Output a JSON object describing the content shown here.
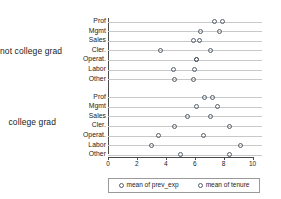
{
  "chart_data": {
    "type": "scatter",
    "title": "",
    "xlabel": "",
    "ylabel": "",
    "xlim": [
      0,
      10
    ],
    "xticks": [
      0,
      2,
      4,
      6,
      8,
      10
    ],
    "xticklabels": [
      "0",
      "2",
      "4",
      "6",
      "8",
      "10"
    ],
    "grid": true,
    "legend_position": "bottom",
    "series": [
      {
        "name": "mean of prev_exp",
        "marker": "open-circle"
      },
      {
        "name": "mean of tenure",
        "marker": "open-circle"
      }
    ],
    "groups": [
      {
        "label": "not college grad",
        "rows": [
          {
            "category": "Prof",
            "mean of prev_exp": 7.4,
            "mean of tenure": 7.9
          },
          {
            "category": "Mgmt",
            "mean of prev_exp": 6.4,
            "mean of tenure": 7.7
          },
          {
            "category": "Sales",
            "mean of prev_exp": 5.9,
            "mean of tenure": 6.3
          },
          {
            "category": "Cler.",
            "mean of prev_exp": 3.6,
            "mean of tenure": 7.1
          },
          {
            "category": "Operat.",
            "mean of prev_exp": 6.1,
            "mean of tenure": 6.1
          },
          {
            "category": "Labor",
            "mean of prev_exp": 4.5,
            "mean of tenure": 6.0
          },
          {
            "category": "Other",
            "mean of prev_exp": 4.6,
            "mean of tenure": 5.9
          }
        ]
      },
      {
        "label": "college grad",
        "rows": [
          {
            "category": "Prof",
            "mean of prev_exp": 6.7,
            "mean of tenure": 7.2
          },
          {
            "category": "Mgmt",
            "mean of prev_exp": 6.1,
            "mean of tenure": 7.6
          },
          {
            "category": "Sales",
            "mean of prev_exp": 5.5,
            "mean of tenure": 7.1
          },
          {
            "category": "Cler.",
            "mean of prev_exp": 4.6,
            "mean of tenure": 8.4
          },
          {
            "category": "Operat.",
            "mean of prev_exp": 3.5,
            "mean of tenure": 6.6
          },
          {
            "category": "Labor",
            "mean of prev_exp": 3.0,
            "mean of tenure": 9.2
          },
          {
            "category": "Other",
            "mean of prev_exp": 5.0,
            "mean of tenure": 8.4
          }
        ]
      }
    ]
  },
  "legend": {
    "entries": [
      {
        "label": "mean of prev_exp"
      },
      {
        "label": "mean of tenure"
      }
    ]
  },
  "colors": {
    "marker_stroke": "#555f6b",
    "gridline": "#c8c8c8",
    "axis": "#4a4a4a",
    "text": "#1a1a1a",
    "background": "#ffffff"
  }
}
